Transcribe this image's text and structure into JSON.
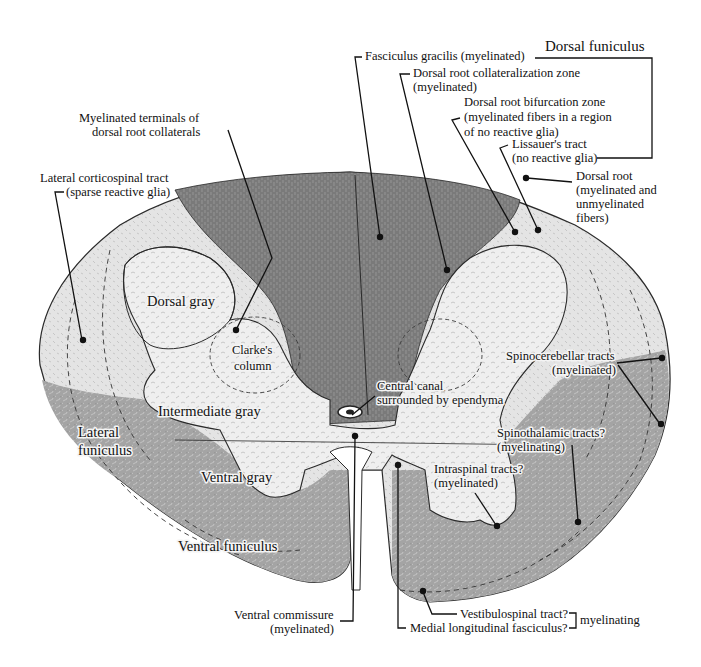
{
  "figure": {
    "colors": {
      "white_matter_dark": "#7d7d7d",
      "white_matter_mid": "#a9a9a9",
      "white_matter_light": "#dcdcdc",
      "gray_matter": "#ececec",
      "outline": "#2a2a2a",
      "background": "#ffffff",
      "text": "#111111"
    }
  },
  "regions": {
    "dorsal_gray": "Dorsal gray",
    "clarkes_column": [
      "Clarke's",
      "column"
    ],
    "intermediate_gray": "Intermediate gray",
    "lateral_funiculus": [
      "Lateral",
      "funiculus"
    ],
    "ventral_gray": "Ventral gray",
    "ventral_funiculus": "Ventral funiculus"
  },
  "labels": {
    "dorsal_funiculus": "Dorsal funiculus",
    "fasciculus_gracilis": "Fasciculus gracilis (myelinated)",
    "dorsal_root_collateralization": [
      "Dorsal root collateralization zone",
      "(myelinated)"
    ],
    "dorsal_root_bifurcation": [
      "Dorsal root bifurcation zone",
      "(myelinated fibers in a region",
      "of no reactive glia)"
    ],
    "lissauers_tract": [
      "Lissauer's tract",
      "(no reactive glia)"
    ],
    "dorsal_root": [
      "Dorsal root",
      "(myelinated and",
      "unmyelinated",
      "fibers)"
    ],
    "myelinated_terminals": [
      "Myelinated terminals of",
      "dorsal root collaterals"
    ],
    "lateral_corticospinal": [
      "Lateral corticospinal tract",
      "(sparse reactive glia)"
    ],
    "central_canal": [
      "Central canal",
      "surrounded by ependyma"
    ],
    "spinocerebellar": [
      "Spinocerebellar tracts",
      "(myelinated)"
    ],
    "spinothalamic": [
      "Spinothalamic tracts?",
      "(myelinating)"
    ],
    "intraspinal": [
      "Intraspinal tracts?",
      "(myelinated)"
    ],
    "ventral_commissure": [
      "Ventral commissure",
      "(myelinated)"
    ],
    "vestibulospinal": "Vestibulospinal tract?",
    "medial_longitudinal": "Medial longitudinal fasciculus?",
    "myelinating_bracket": "myelinating"
  }
}
